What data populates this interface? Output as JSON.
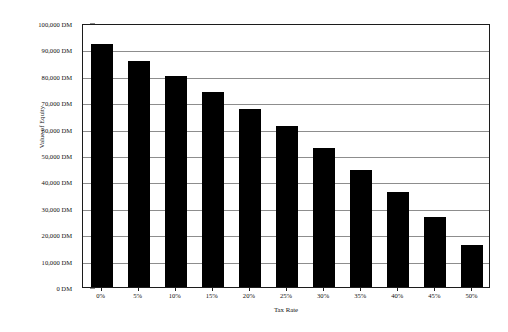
{
  "chart_data": {
    "type": "bar",
    "title": "",
    "xlabel": "Tax Rate",
    "ylabel": "Value of Equity",
    "categories": [
      "0%",
      "5%",
      "10%",
      "15%",
      "20%",
      "25%",
      "30%",
      "35%",
      "40%",
      "45%",
      "50%"
    ],
    "values": [
      92000,
      85500,
      80000,
      74000,
      67500,
      61000,
      52500,
      44500,
      36000,
      26500,
      16000
    ],
    "ylim": [
      0,
      100000
    ],
    "ytick_values": [
      0,
      10000,
      20000,
      30000,
      40000,
      50000,
      60000,
      70000,
      80000,
      90000,
      100000
    ],
    "ytick_labels": [
      "0 DM",
      "10,000 DM",
      "20,000 DM",
      "30,000 DM",
      "40,000 DM",
      "50,000 DM",
      "60,000 DM",
      "70,000 DM",
      "80,000 DM",
      "90,000 DM",
      "100,000 DM"
    ],
    "unit": "DM",
    "grid": true,
    "legend": false,
    "bar_color": "#000000",
    "gridline_color": "#8d8d8d",
    "frame_color": "#1c1c1c",
    "background_color": "#ffffff"
  }
}
